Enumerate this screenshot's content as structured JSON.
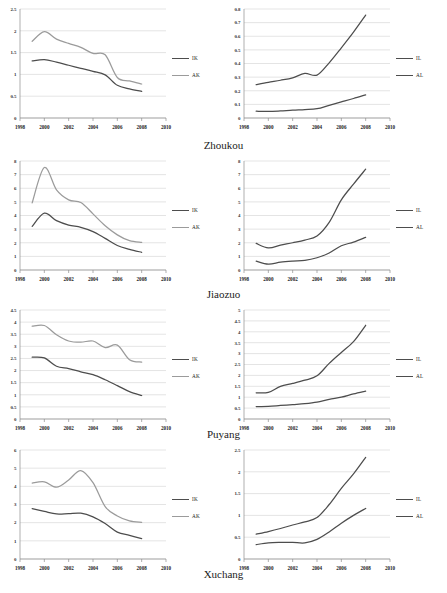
{
  "figure": {
    "panel_width": 223,
    "panel_height": 142,
    "colors": {
      "dark_series": "#4d4d4d",
      "light_series": "#9b9b9b",
      "grid": "#c9c9c9",
      "axis": "#8d8d8d"
    }
  },
  "cities": [
    {
      "name": "Zhoukou"
    },
    {
      "name": "Jiaozuo"
    },
    {
      "name": "Puyang"
    },
    {
      "name": "Xuchang"
    }
  ],
  "chart_data": [
    {
      "type": "line",
      "title": "Zhoukou",
      "panel": "left",
      "xlabel": "",
      "ylabel": "",
      "xlim": [
        1998,
        2010
      ],
      "ylim": [
        0,
        2.5
      ],
      "yticks": [
        0,
        0.5,
        1,
        1.5,
        2,
        2.5
      ],
      "yticklabels": [
        "0",
        "0.5",
        "1",
        "1.5",
        "2",
        "2.5"
      ],
      "xticks": [
        1998,
        2000,
        2002,
        2004,
        2006,
        2008,
        2010
      ],
      "xticklabels": [
        "1998",
        "2000",
        "2002",
        "2004",
        "2006",
        "2008",
        "2010"
      ],
      "grid": true,
      "legend_position": "right",
      "x": [
        1999,
        2000,
        2001,
        2002,
        2003,
        2004,
        2005,
        2006,
        2007,
        2008
      ],
      "series": [
        {
          "name": "IK",
          "color": "#4d4d4d",
          "values": [
            1.31,
            1.34,
            1.28,
            1.21,
            1.14,
            1.07,
            0.99,
            0.75,
            0.67,
            0.61
          ]
        },
        {
          "name": "AK",
          "color": "#9b9b9b",
          "values": [
            1.76,
            1.98,
            1.81,
            1.71,
            1.62,
            1.48,
            1.45,
            0.93,
            0.85,
            0.78
          ]
        }
      ]
    },
    {
      "type": "line",
      "title": "Zhoukou",
      "panel": "right",
      "xlabel": "",
      "ylabel": "",
      "xlim": [
        1998,
        2010
      ],
      "ylim": [
        0,
        0.8
      ],
      "yticks": [
        0,
        0.1,
        0.2,
        0.3,
        0.4,
        0.5,
        0.6,
        0.7,
        0.8
      ],
      "yticklabels": [
        "0",
        "0.1",
        "0.2",
        "0.3",
        "0.4",
        "0.5",
        "0.6",
        "0.7",
        "0.8"
      ],
      "xticks": [
        1998,
        2000,
        2002,
        2004,
        2006,
        2008,
        2010
      ],
      "xticklabels": [
        "1998",
        "2000",
        "2002",
        "2004",
        "2006",
        "2008",
        "2010"
      ],
      "grid": true,
      "legend_position": "right",
      "x": [
        1999,
        2000,
        2001,
        2002,
        2003,
        2004,
        2005,
        2006,
        2007,
        2008
      ],
      "series": [
        {
          "name": "IL",
          "color": "#4d4d4d",
          "values": [
            0.245,
            0.262,
            0.277,
            0.295,
            0.327,
            0.315,
            0.405,
            0.515,
            0.63,
            0.755
          ]
        },
        {
          "name": "AL",
          "color": "#4d4d4d",
          "values": [
            0.05,
            0.048,
            0.052,
            0.058,
            0.062,
            0.068,
            0.093,
            0.118,
            0.143,
            0.17
          ]
        }
      ]
    },
    {
      "type": "line",
      "title": "Jiaozuo",
      "panel": "left",
      "xlabel": "",
      "ylabel": "",
      "xlim": [
        1998,
        2010
      ],
      "ylim": [
        0,
        8
      ],
      "yticks": [
        0,
        1,
        2,
        3,
        4,
        5,
        6,
        7,
        8
      ],
      "yticklabels": [
        "0",
        "1",
        "2",
        "3",
        "4",
        "5",
        "6",
        "7",
        "8"
      ],
      "xticks": [
        1998,
        2000,
        2002,
        2004,
        2006,
        2008,
        2010
      ],
      "xticklabels": [
        "1998",
        "2000",
        "2002",
        "2004",
        "2006",
        "2008",
        "2010"
      ],
      "grid": true,
      "legend_position": "right",
      "x": [
        1999,
        2000,
        2001,
        2002,
        2003,
        2004,
        2005,
        2006,
        2007,
        2008
      ],
      "series": [
        {
          "name": "IK",
          "color": "#4d4d4d",
          "values": [
            3.2,
            4.17,
            3.62,
            3.3,
            3.13,
            2.82,
            2.32,
            1.8,
            1.52,
            1.3
          ]
        },
        {
          "name": "AK",
          "color": "#9b9b9b",
          "values": [
            4.93,
            7.52,
            5.88,
            5.15,
            4.95,
            4.12,
            3.25,
            2.58,
            2.15,
            2.02
          ]
        }
      ]
    },
    {
      "type": "line",
      "title": "Jiaozuo",
      "panel": "right",
      "xlabel": "",
      "ylabel": "",
      "xlim": [
        1998,
        2010
      ],
      "ylim": [
        0,
        8
      ],
      "yticks": [
        0,
        1,
        2,
        3,
        4,
        5,
        6,
        7,
        8
      ],
      "yticklabels": [
        "0",
        "1",
        "2",
        "3",
        "4",
        "5",
        "6",
        "7",
        "8"
      ],
      "xticks": [
        1998,
        2000,
        2002,
        2004,
        2006,
        2008,
        2010
      ],
      "xticklabels": [
        "1998",
        "2000",
        "2002",
        "2004",
        "2006",
        "2008",
        "2010"
      ],
      "grid": true,
      "legend_position": "right",
      "x": [
        1999,
        2000,
        2001,
        2002,
        2003,
        2004,
        2005,
        2006,
        2007,
        2008
      ],
      "series": [
        {
          "name": "IL",
          "color": "#4d4d4d",
          "values": [
            1.95,
            1.62,
            1.82,
            2.0,
            2.2,
            2.5,
            3.5,
            5.15,
            6.3,
            7.4
          ]
        },
        {
          "name": "AL",
          "color": "#4d4d4d",
          "values": [
            0.65,
            0.43,
            0.57,
            0.65,
            0.7,
            0.9,
            1.25,
            1.78,
            2.05,
            2.4
          ]
        }
      ]
    },
    {
      "type": "line",
      "title": "Puyang",
      "panel": "left",
      "xlabel": "",
      "ylabel": "",
      "xlim": [
        1998,
        2010
      ],
      "ylim": [
        0,
        4.5
      ],
      "yticks": [
        0,
        0.5,
        1,
        1.5,
        2,
        2.5,
        3,
        3.5,
        4,
        4.5
      ],
      "yticklabels": [
        "0",
        "0.5",
        "1",
        "1.5",
        "2",
        "2.5",
        "3",
        "3.5",
        "4",
        "4.5"
      ],
      "xticks": [
        1998,
        2000,
        2002,
        2004,
        2006,
        2008,
        2010
      ],
      "xticklabels": [
        "1998",
        "2000",
        "2002",
        "2004",
        "2006",
        "2008",
        "2010"
      ],
      "grid": true,
      "legend_position": "right",
      "x": [
        1999,
        2000,
        2001,
        2002,
        2003,
        2004,
        2005,
        2006,
        2007,
        2008
      ],
      "series": [
        {
          "name": "IK",
          "color": "#4d4d4d",
          "values": [
            2.55,
            2.52,
            2.18,
            2.08,
            1.95,
            1.83,
            1.62,
            1.38,
            1.13,
            0.97
          ]
        },
        {
          "name": "AK",
          "color": "#9b9b9b",
          "values": [
            3.83,
            3.86,
            3.48,
            3.22,
            3.17,
            3.22,
            2.95,
            3.05,
            2.45,
            2.35
          ]
        }
      ]
    },
    {
      "type": "line",
      "title": "Puyang",
      "panel": "right",
      "xlabel": "",
      "ylabel": "",
      "xlim": [
        1998,
        2010
      ],
      "ylim": [
        0,
        5
      ],
      "yticks": [
        0,
        0.5,
        1,
        1.5,
        2,
        2.5,
        3,
        3.5,
        4,
        4.5,
        5
      ],
      "yticklabels": [
        "0",
        "0.5",
        "1",
        "1.5",
        "2",
        "2.5",
        "3",
        "3.5",
        "4",
        "4.5",
        "5"
      ],
      "xticks": [
        1998,
        2000,
        2002,
        2004,
        2006,
        2008,
        2010
      ],
      "xticklabels": [
        "1998",
        "2000",
        "2002",
        "2004",
        "2006",
        "2008",
        "2010"
      ],
      "grid": true,
      "legend_position": "right",
      "x": [
        1999,
        2000,
        2001,
        2002,
        2003,
        2004,
        2005,
        2006,
        2007,
        2008
      ],
      "series": [
        {
          "name": "IL",
          "color": "#4d4d4d",
          "values": [
            1.2,
            1.22,
            1.5,
            1.63,
            1.78,
            1.98,
            2.55,
            3.05,
            3.55,
            4.3
          ]
        },
        {
          "name": "AL",
          "color": "#4d4d4d",
          "values": [
            0.57,
            0.58,
            0.62,
            0.66,
            0.7,
            0.77,
            0.9,
            1.0,
            1.15,
            1.28
          ]
        }
      ]
    },
    {
      "type": "line",
      "title": "Xuchang",
      "panel": "left",
      "xlabel": "",
      "ylabel": "",
      "xlim": [
        1998,
        2010
      ],
      "ylim": [
        0,
        6
      ],
      "yticks": [
        0,
        1,
        2,
        3,
        4,
        5,
        6
      ],
      "yticklabels": [
        "0",
        "1",
        "2",
        "3",
        "4",
        "5",
        "6"
      ],
      "xticks": [
        1998,
        2000,
        2002,
        2004,
        2006,
        2008,
        2010
      ],
      "xticklabels": [
        "1998",
        "2000",
        "2002",
        "2004",
        "2006",
        "2008",
        "2010"
      ],
      "grid": true,
      "legend_position": "right",
      "x": [
        1999,
        2000,
        2001,
        2002,
        2003,
        2004,
        2005,
        2006,
        2007,
        2008
      ],
      "series": [
        {
          "name": "IK",
          "color": "#4d4d4d",
          "values": [
            2.77,
            2.62,
            2.48,
            2.5,
            2.52,
            2.32,
            1.95,
            1.48,
            1.3,
            1.12
          ]
        },
        {
          "name": "AK",
          "color": "#9b9b9b",
          "values": [
            4.18,
            4.25,
            3.95,
            4.35,
            4.87,
            4.2,
            2.88,
            2.37,
            2.1,
            2.02
          ]
        }
      ]
    },
    {
      "type": "line",
      "title": "Xuchang",
      "panel": "right",
      "xlabel": "",
      "ylabel": "",
      "xlim": [
        1998,
        2010
      ],
      "ylim": [
        0,
        2.5
      ],
      "yticks": [
        0,
        0.5,
        1,
        1.5,
        2,
        2.5
      ],
      "yticklabels": [
        "0",
        "0.5",
        "1",
        "1.5",
        "2",
        "2.5"
      ],
      "xticks": [
        1998,
        2000,
        2002,
        2004,
        2006,
        2008,
        2010
      ],
      "xticklabels": [
        "1998",
        "2000",
        "2002",
        "2004",
        "2006",
        "2008",
        "2010"
      ],
      "grid": true,
      "legend_position": "right",
      "x": [
        1999,
        2000,
        2001,
        2002,
        2003,
        2004,
        2005,
        2006,
        2007,
        2008
      ],
      "series": [
        {
          "name": "IL",
          "color": "#4d4d4d",
          "values": [
            0.57,
            0.63,
            0.7,
            0.78,
            0.85,
            0.95,
            1.25,
            1.62,
            1.95,
            2.33
          ]
        },
        {
          "name": "AL",
          "color": "#4d4d4d",
          "values": [
            0.33,
            0.37,
            0.38,
            0.38,
            0.37,
            0.45,
            0.62,
            0.82,
            1.0,
            1.16
          ]
        }
      ]
    }
  ]
}
